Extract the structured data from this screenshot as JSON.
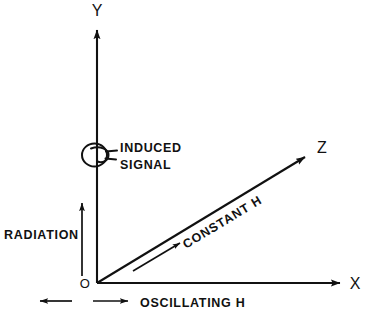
{
  "figure": {
    "background_color": "#ffffff",
    "ink_color": "#111111"
  },
  "axes": [
    {
      "id": "y",
      "label": "Y",
      "description": "vertical axis pointing up"
    },
    {
      "id": "x",
      "label": "X",
      "description": "horizontal axis pointing right"
    },
    {
      "id": "z",
      "label": "Z",
      "description": "oblique axis pointing upper right"
    }
  ],
  "origin": {
    "label": "O"
  },
  "annotations": {
    "induced_signal": {
      "line1": "INDUCED",
      "line2": "SIGNAL",
      "icon": "coil-icon"
    },
    "radiation": {
      "label": "RADIATION",
      "icon": "up-arrow-icon"
    },
    "constant_field": {
      "label": "CONSTANT  H",
      "icon": "z-direction-arrow-icon"
    },
    "oscillating_field": {
      "label": "OSCILLATING  H",
      "icon": "double-arrow-icon"
    }
  }
}
